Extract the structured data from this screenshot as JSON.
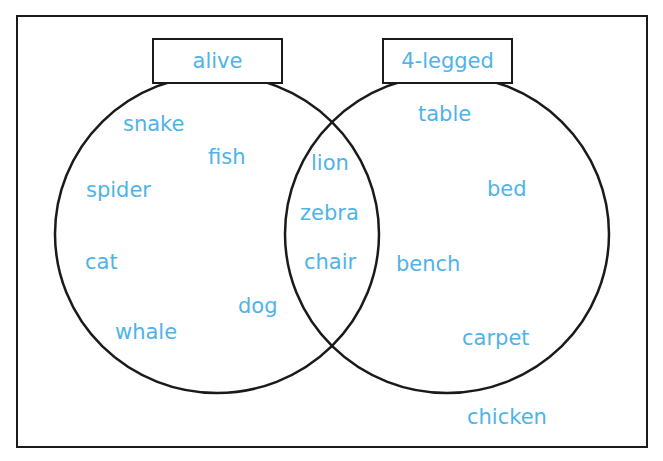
{
  "diagram": {
    "type": "venn",
    "text_color": "#4fb3e8",
    "line_color": "#1a1a1a",
    "sets": [
      {
        "label": "alive"
      },
      {
        "label": "4-legged"
      }
    ],
    "only_alive": [
      "snake",
      "fish",
      "spider",
      "cat",
      "dog",
      "whale"
    ],
    "both": [
      "lion",
      "zebra",
      "chair"
    ],
    "only_4_legged": [
      "table",
      "bed",
      "bench",
      "carpet"
    ],
    "outside": [
      "chicken"
    ]
  }
}
